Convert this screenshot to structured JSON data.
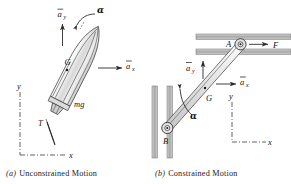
{
  "figure": {
    "title_hidden": "",
    "panels": [
      {
        "id": "panel-a",
        "caption_tag": "(a)",
        "caption_text": "Unconstrained Motion",
        "subject": "rocket",
        "labels": {
          "accel_y": "a",
          "accel_y_sub": "y",
          "accel_x": "a",
          "accel_x_sub": "x",
          "alpha": "α",
          "center_of_mass": "G",
          "weight": "mg",
          "thrust": "T",
          "axis_y": "y",
          "axis_x": "x"
        }
      },
      {
        "id": "panel-b",
        "caption_tag": "(b)",
        "caption_text": "Constrained Motion",
        "subject": "slider-bar",
        "labels": {
          "pin_top": "A",
          "pin_bottom": "B",
          "force": "F",
          "accel_y": "a",
          "accel_y_sub": "y",
          "accel_x": "a",
          "accel_x_sub": "x",
          "alpha": "α",
          "center_of_mass": "G",
          "axis_y": "y",
          "axis_x": "x"
        }
      }
    ],
    "colors": {
      "ink": "#1a1a1a",
      "line": "#2b2b2b",
      "guide": "#3a3a3a",
      "body_fill": "#e9e9e9",
      "slot_fill": "#b9b9b9",
      "background": "#ffffff"
    }
  }
}
